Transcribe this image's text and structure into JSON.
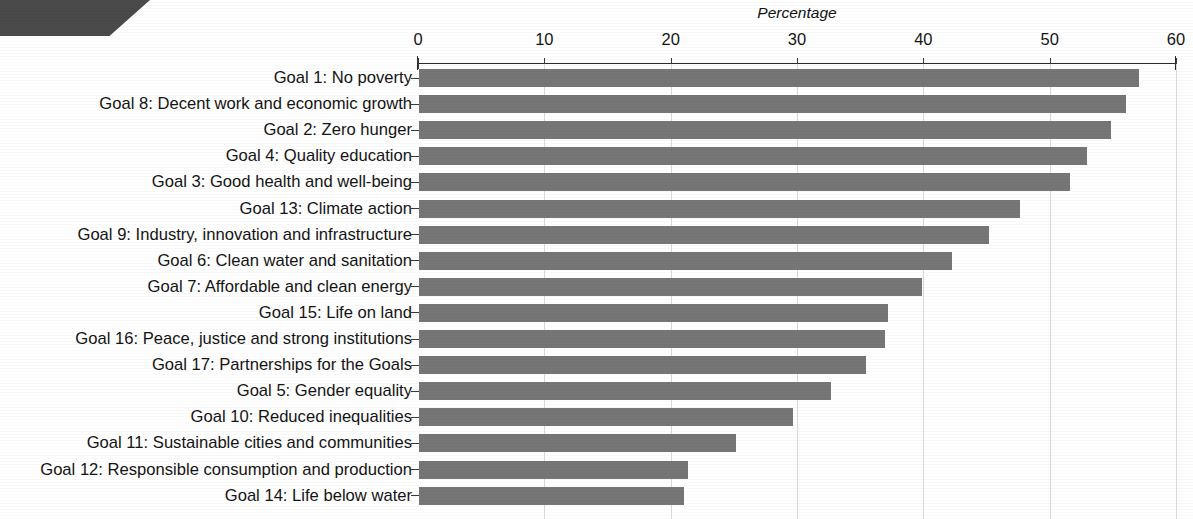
{
  "chart_data": {
    "type": "bar",
    "orientation": "horizontal",
    "title": "",
    "xlabel": "Percentage",
    "ylabel": "",
    "xlim": [
      0,
      60
    ],
    "xticks": [
      0,
      10,
      20,
      30,
      40,
      50,
      60
    ],
    "xtick_labels": [
      "0",
      "10",
      "20",
      "30",
      "40",
      "50",
      "60"
    ],
    "grid": true,
    "grid_axis": "x",
    "legend": false,
    "bar_color": "#767676",
    "axis_color": "#2b2b2b",
    "gridline_color": "#d9d9d9",
    "categories": [
      "Goal 1: No poverty",
      "Goal 8: Decent work and economic growth",
      "Goal 2: Zero hunger",
      "Goal 4: Quality education",
      "Goal 3: Good health and well-being",
      "Goal 13: Climate action",
      "Goal 9: Industry, innovation and infrastructure",
      "Goal 6: Clean water and sanitation",
      "Goal 7: Affordable and clean energy",
      "Goal 15: Life on land",
      "Goal 16: Peace, justice and strong institutions",
      "Goal 17: Partnerships for the Goals",
      "Goal 5: Gender equality",
      "Goal 10: Reduced inequalities",
      "Goal 11: Sustainable cities and communities",
      "Goal 12: Responsible consumption and production",
      "Goal 14: Life below water"
    ],
    "values": [
      57.0,
      56.0,
      54.8,
      52.9,
      51.5,
      47.6,
      45.1,
      42.2,
      39.8,
      37.1,
      36.9,
      35.4,
      32.6,
      29.6,
      25.1,
      21.3,
      21.0
    ]
  }
}
